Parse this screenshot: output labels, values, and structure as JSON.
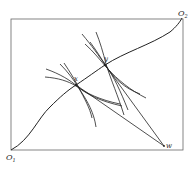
{
  "diagram": {
    "type": "edgeworth-box",
    "labels": {
      "origin_1": "O",
      "origin_1_sub": "1",
      "origin_2": "O",
      "origin_2_sub": "2",
      "point_x": "x",
      "point_y": "y",
      "point_w": "w"
    },
    "colors": {
      "stroke": "#222222",
      "box": "#555555",
      "background": "#ffffff"
    },
    "caption": ""
  }
}
